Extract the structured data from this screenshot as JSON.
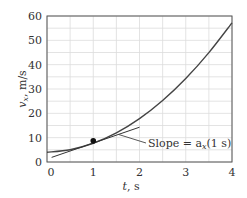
{
  "chart_data": {
    "type": "line",
    "title": "",
    "xlabel": "t, s",
    "ylabel": "v_x, m/s",
    "xlim": [
      0,
      4
    ],
    "ylim": [
      0,
      60
    ],
    "grid": true,
    "x_ticks": [
      0,
      1,
      2,
      3,
      4
    ],
    "y_ticks": [
      0,
      10,
      20,
      30,
      40,
      50,
      60
    ],
    "series": [
      {
        "name": "velocity curve",
        "x": [
          0,
          0.5,
          1,
          1.5,
          2,
          2.5,
          3,
          3.5,
          4
        ],
        "values": [
          4,
          5.05,
          7.7,
          11.95,
          17.8,
          25.25,
          34.3,
          44.95,
          57.2
        ]
      },
      {
        "name": "tangent at t = 1 s",
        "x": [
          0.1,
          2.0
        ],
        "values": [
          1.9,
          14.3
        ]
      }
    ],
    "point": {
      "x": 1,
      "y": 8.7
    },
    "annotation": {
      "text": "Slope = a_x(1 s)",
      "target_x": 1.55,
      "target_y": 11.3
    }
  },
  "labels": {
    "xlabel_t": "t",
    "xlabel_unit": ", s",
    "ylabel_v": "v",
    "ylabel_sub": "x",
    "ylabel_unit": ", m/s",
    "annotation_prefix": "Slope = a",
    "annotation_sub": "x",
    "annotation_suffix": "(1 s)"
  }
}
